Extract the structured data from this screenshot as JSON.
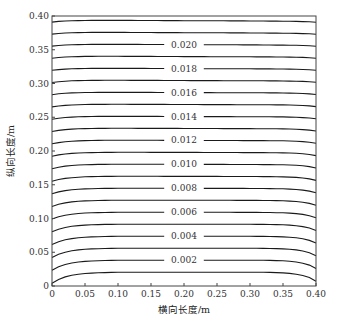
{
  "chart_data": {
    "type": "contour",
    "title": "",
    "xlabel": "横向长度/m",
    "ylabel": "纵向长度/m",
    "xlim": [
      0,
      0.4
    ],
    "ylim": [
      0,
      0.4
    ],
    "xticks": [
      "0",
      "0.05",
      "0.10",
      "0.15",
      "0.20",
      "0.25",
      "0.30",
      "0.35",
      "0.40"
    ],
    "yticks": [
      "0",
      "0.05",
      "0.10",
      "0.15",
      "0.20",
      "0.25",
      "0.30",
      "0.35",
      "0.40"
    ],
    "grid": false,
    "legend": null,
    "contour_levels": [
      0.001,
      0.002,
      0.003,
      0.004,
      0.005,
      0.006,
      0.007,
      0.008,
      0.009,
      0.01,
      0.011,
      0.012,
      0.013,
      0.014,
      0.015,
      0.016,
      0.017,
      0.018,
      0.019,
      0.02,
      0.021,
      0.022
    ],
    "labeled_levels": [
      "0.002",
      "0.004",
      "0.006",
      "0.008",
      "0.010",
      "0.012",
      "0.014",
      "0.016",
      "0.018",
      "0.020"
    ],
    "approx_level_y_at_center_m": [
      0.0205,
      0.0383,
      0.056,
      0.0737,
      0.0915,
      0.1092,
      0.127,
      0.1447,
      0.1624,
      0.1802,
      0.1979,
      0.2157,
      0.2334,
      0.2511,
      0.2689,
      0.2866,
      0.3044,
      0.3221,
      0.3399,
      0.3576,
      0.3753,
      0.3931
    ]
  }
}
